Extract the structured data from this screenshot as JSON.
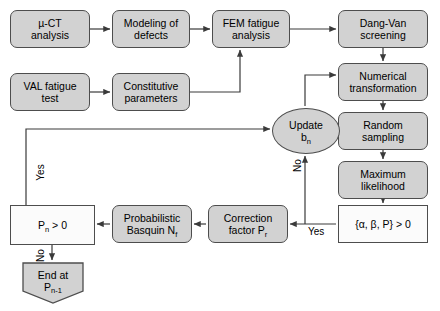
{
  "diagram": {
    "colors": {
      "gray_fill": "#d2d2d2",
      "white_fill": "#fbfbfb",
      "stroke": "#4d4d4d",
      "text": "#000000",
      "background": "#ffffff"
    },
    "nodes": [
      {
        "id": "n1",
        "label_line1": "µ-CT",
        "label_line2": "analysis",
        "shape": "rounded-rect",
        "fill": "gray",
        "x": 10,
        "y": 10,
        "w": 80,
        "h": 38
      },
      {
        "id": "n2",
        "label_line1": "Modeling of",
        "label_line2": "defects",
        "shape": "rounded-rect",
        "fill": "gray",
        "x": 112,
        "y": 10,
        "w": 78,
        "h": 38
      },
      {
        "id": "n3",
        "label_line1": "FEM fatigue",
        "label_line2": "analysis",
        "shape": "rounded-rect",
        "fill": "gray",
        "x": 212,
        "y": 10,
        "w": 78,
        "h": 38
      },
      {
        "id": "n4",
        "label_line1": "Dang-Van",
        "label_line2": "screening",
        "shape": "rounded-rect",
        "fill": "gray",
        "x": 338,
        "y": 10,
        "w": 90,
        "h": 38
      },
      {
        "id": "n5",
        "label_line1": "VAL fatigue",
        "label_line2": "test",
        "shape": "rounded-rect",
        "fill": "gray",
        "x": 10,
        "y": 73,
        "w": 80,
        "h": 38
      },
      {
        "id": "n6",
        "label_line1": "Constitutive",
        "label_line2": "parameters",
        "shape": "rounded-rect",
        "fill": "gray",
        "x": 112,
        "y": 73,
        "w": 78,
        "h": 38
      },
      {
        "id": "n7",
        "label_line1": "Numerical",
        "label_line2": "transformation",
        "shape": "rounded-rect",
        "fill": "gray",
        "x": 338,
        "y": 63,
        "w": 90,
        "h": 38
      },
      {
        "id": "n8",
        "label_line1": "Random",
        "label_line2": "sampling",
        "shape": "rounded-rect",
        "fill": "gray",
        "x": 338,
        "y": 112,
        "w": 90,
        "h": 38
      },
      {
        "id": "n9",
        "label_line1": "Maximum",
        "label_line2": "likelihood",
        "shape": "rounded-rect",
        "fill": "gray",
        "x": 338,
        "y": 161,
        "w": 90,
        "h": 38
      },
      {
        "id": "n10",
        "label_line1": "{α, β, P} > 0",
        "label_line2": "",
        "shape": "rect",
        "fill": "white",
        "x": 338,
        "y": 205,
        "w": 90,
        "h": 38
      },
      {
        "id": "n11",
        "label_line1": "Correction",
        "label_line2": "factor P",
        "label_line2_sub": "r",
        "shape": "rounded-rect",
        "fill": "gray",
        "x": 208,
        "y": 205,
        "w": 80,
        "h": 38
      },
      {
        "id": "n12",
        "label_line1": "Probabilistic",
        "label_line2": "Basquin N",
        "label_line2_sub": "f",
        "shape": "rounded-rect",
        "fill": "gray",
        "x": 112,
        "y": 205,
        "w": 80,
        "h": 38
      },
      {
        "id": "n13",
        "label_line1": "P",
        "label_line1_sub": "n",
        "label_line1_tail": " > 0",
        "label_line2": "",
        "shape": "rect",
        "fill": "white",
        "x": 10,
        "y": 205,
        "w": 85,
        "h": 40
      },
      {
        "id": "n14",
        "label_line1": "End at",
        "label_line2": "P",
        "label_line2_sub": "n-1",
        "shape": "pentagon",
        "fill": "gray",
        "x": 22,
        "y": 262,
        "w": 62,
        "h": 42
      },
      {
        "id": "n15",
        "label_line1": "Update",
        "label_line2": "b",
        "label_line2_sub": "n",
        "shape": "ellipse",
        "fill": "gray",
        "x": 272,
        "y": 108,
        "w": 68,
        "h": 46
      }
    ],
    "edge_labels": [
      {
        "id": "e-no-right",
        "text": "No",
        "x": 297,
        "y": 168,
        "rotated": true
      },
      {
        "id": "e-yes-right",
        "text": "Yes",
        "x": 308,
        "y": 228,
        "rotated": false
      },
      {
        "id": "e-yes-left",
        "text": "Yes",
        "x": 41,
        "y": 173,
        "rotated": true
      },
      {
        "id": "e-no-left",
        "text": "No",
        "x": 41,
        "y": 252,
        "rotated": true
      }
    ]
  }
}
